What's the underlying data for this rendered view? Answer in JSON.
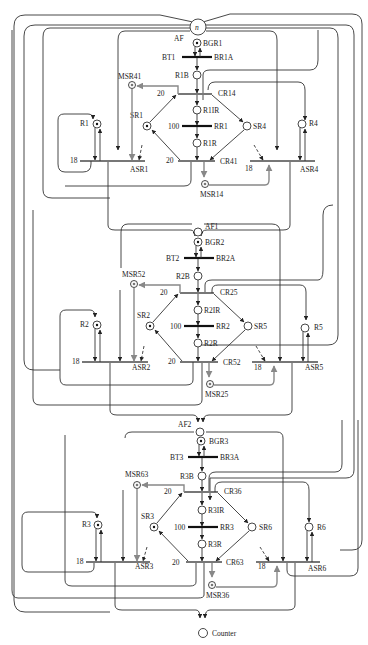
{
  "diagram": {
    "type": "petri-net",
    "top_place": {
      "label": "AF",
      "token_label": "n"
    },
    "sections": [
      {
        "id": 1,
        "entry_place": "AF",
        "bgr": "BGR1",
        "bt": "BT1",
        "bra": "BR1A",
        "rb": "R1B",
        "rir": "R1IR",
        "rr": "RR1",
        "rr_weight": "100",
        "rr_place": "R1R",
        "cr_top": "CR14",
        "cr_top_weight": "20",
        "cr_bot": "CR41",
        "cr_bot_weight": "20",
        "msr_top": "MSR41",
        "msr_bot": "MSR14",
        "sr_left": "SR1",
        "sr_right": "SR4",
        "r_left": "R1",
        "r_right": "R4",
        "asr_left": "ASR1",
        "asr_left_weight": "18",
        "asr_right": "ASR4",
        "asr_right_weight": "18"
      },
      {
        "id": 2,
        "entry_place": "AF1",
        "bgr": "BGR2",
        "bt": "BT2",
        "bra": "BR2A",
        "rb": "R2B",
        "rir": "R2IR",
        "rr": "RR2",
        "rr_weight": "100",
        "rr_place": "R2R",
        "cr_top": "CR25",
        "cr_top_weight": "20",
        "cr_bot": "CR52",
        "cr_bot_weight": "20",
        "msr_top": "MSR52",
        "msr_bot": "MSR25",
        "sr_left": "SR2",
        "sr_right": "SR5",
        "r_left": "R2",
        "r_right": "R5",
        "asr_left": "ASR2",
        "asr_left_weight": "18",
        "asr_right": "ASR5",
        "asr_right_weight": "18"
      },
      {
        "id": 3,
        "entry_place": "AF2",
        "bgr": "BGR3",
        "bt": "BT3",
        "bra": "BR3A",
        "rb": "R3B",
        "rir": "R3IR",
        "rr": "RR3",
        "rr_weight": "100",
        "rr_place": "R3R",
        "cr_top": "CR36",
        "cr_top_weight": "20",
        "cr_bot": "CR63",
        "cr_bot_weight": "20",
        "msr_top": "MSR63",
        "msr_bot": "MSR36",
        "sr_left": "SR3",
        "sr_right": "SR6",
        "r_left": "R3",
        "r_right": "R6",
        "asr_left": "ASR3",
        "asr_left_weight": "18",
        "asr_right": "ASR6",
        "asr_right_weight": "18"
      }
    ],
    "sink_place": "Counter",
    "colors": {
      "line": "#333333",
      "inhibitor_gray": "#888888",
      "token": "#111111",
      "background": "#ffffff"
    }
  }
}
